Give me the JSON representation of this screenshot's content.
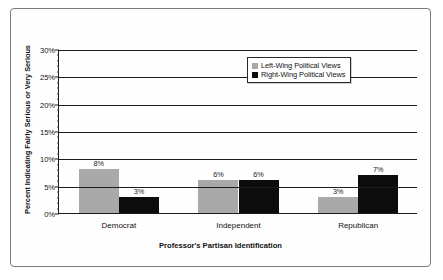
{
  "chart_data": {
    "type": "bar",
    "title": "",
    "xlabel": "Professor's Partisan Identification",
    "ylabel": "Percent Indicating Fairly Serious or Very Serious",
    "categories": [
      "Democrat",
      "Independent",
      "Republican"
    ],
    "series": [
      {
        "name": "Left-Wing Political Views",
        "color": "#a9a9a9",
        "values": [
          8,
          6,
          3
        ],
        "labels": [
          "8%",
          "6%",
          "3%"
        ]
      },
      {
        "name": "Right-Wing Political Views",
        "color": "#0c0c0c",
        "values": [
          3,
          6,
          7
        ],
        "labels": [
          "3%",
          "6%",
          "7%"
        ]
      }
    ],
    "ylim": [
      0,
      30
    ],
    "yticks": [
      0,
      5,
      10,
      15,
      20,
      25,
      30
    ],
    "ytick_labels": [
      "0%",
      "5%",
      "10%",
      "15%",
      "20%",
      "25%",
      "30%"
    ],
    "grid": true,
    "legend_position": "top-right"
  }
}
